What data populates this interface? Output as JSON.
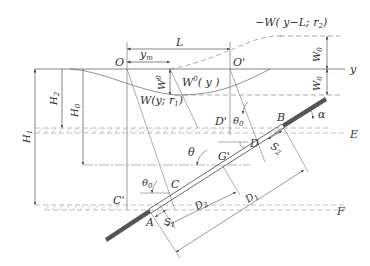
{
  "figure": {
    "type": "engineering-diagram"
  },
  "labels": {
    "origin": "O",
    "origin_prime": "O'",
    "y_axis": "y",
    "L": "L",
    "y_m": "y",
    "y_m_sub": "m",
    "W0_vertical": "W",
    "W0_vertical_sup": "0",
    "W0_curve": "W",
    "W0_curve_sup": "0",
    "W0_curve_arg": "( y )",
    "W_curve": "W(y;  r",
    "W_curve_sub": "1",
    "W_curve_close": ")",
    "neg_W_curve": "−W( y−L;  r",
    "neg_W_curve_sub": "2",
    "neg_W_curve_close": ")",
    "W0_top": "W",
    "W0_top_sub": "0",
    "W0_bottom": "W",
    "W0_bottom_sub": "0",
    "H1": "H",
    "H1_sub": "1",
    "H2": "H",
    "H2_sub": "2",
    "H0": "H",
    "H0_sub": "0",
    "E": "E",
    "F": "F",
    "A": "A",
    "B": "B",
    "C": "C",
    "C_prime": "C'",
    "D": "D",
    "D_prime": "D'",
    "G_prime": "G'",
    "theta": "θ",
    "theta0_upper": "θ",
    "theta0_upper_sub": "0",
    "theta0_lower": "θ",
    "theta0_lower_sub": "0",
    "alpha": "α",
    "S1": "S",
    "S1_sub": "1",
    "S2": "S",
    "S2_sub": "2",
    "D1": "D",
    "D1_sub": "1",
    "D2": "D",
    "D2_sub": "2"
  },
  "colors": {
    "line": "#555555",
    "pipe_dark": "#555555",
    "dashed": "#888888",
    "text": "#333333"
  }
}
